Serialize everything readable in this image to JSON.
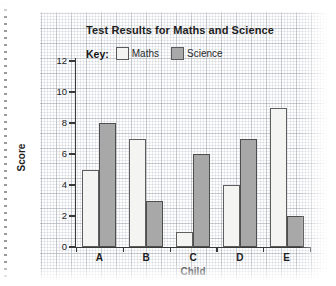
{
  "chart_data": {
    "type": "bar",
    "title": "Test Results for Maths and Science",
    "xlabel": "Child",
    "ylabel": "Score",
    "categories": [
      "A",
      "B",
      "C",
      "D",
      "E"
    ],
    "series": [
      {
        "name": "Maths",
        "values": [
          5,
          7,
          1,
          4,
          9
        ],
        "color": "#f4f4f2"
      },
      {
        "name": "Science",
        "values": [
          8,
          3,
          6,
          7,
          2
        ],
        "color": "#a8a8a8"
      }
    ],
    "ylim": [
      0,
      12
    ],
    "yticks": [
      "0",
      "2",
      "4",
      "6",
      "8",
      "10",
      "12"
    ],
    "grid": true,
    "legend_position": "top",
    "legend_label": "Key:"
  },
  "legend": {
    "key_label": "Key:",
    "maths_label": "Maths",
    "science_label": "Science"
  },
  "axes": {
    "y_title": "Score",
    "x_title": "Child",
    "y_ticks": [
      "12",
      "10",
      "8",
      "6",
      "4",
      "2",
      "0"
    ],
    "x_categories": [
      "A",
      "B",
      "C",
      "D",
      "E"
    ]
  }
}
